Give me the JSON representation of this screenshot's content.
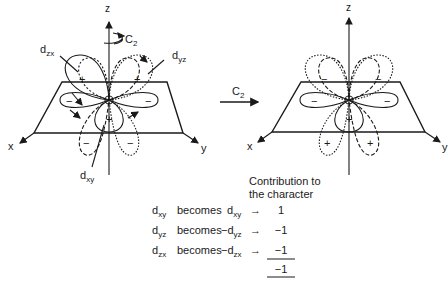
{
  "operation": {
    "label": "C",
    "subscript": "2"
  },
  "left_diagram": {
    "axes": {
      "z": "z",
      "x": "x",
      "y": "y"
    },
    "rotation_label": {
      "label": "C",
      "subscript": "2"
    },
    "orbital_labels": {
      "dzx": {
        "base": "d",
        "sub": "zx"
      },
      "dyz": {
        "base": "d",
        "sub": "yz"
      },
      "dxy": {
        "base": "d",
        "sub": "xy"
      }
    },
    "signs": {
      "dzx_upper": "+",
      "dyz_upper": "+",
      "left_lobe": "−",
      "right_lobe": "−",
      "front_lobe": "+",
      "lower_left": "−",
      "lower_right": "−"
    }
  },
  "right_diagram": {
    "axes": {
      "z": "z",
      "x": "x",
      "y": "y"
    },
    "signs": {
      "upper_left": "−",
      "upper_right": "−",
      "left_lobe": "−",
      "right_lobe": "−",
      "front_lobe": "+",
      "lower_left": "+",
      "lower_right": "+"
    }
  },
  "table": {
    "header_line1": "Contribution to",
    "header_line2": "the character",
    "rows": [
      {
        "from_base": "d",
        "from_sub": "xy",
        "verb": "becomes",
        "to_sign": "",
        "to_base": "d",
        "to_sub": "xy",
        "value": "1"
      },
      {
        "from_base": "d",
        "from_sub": "yz",
        "verb": "becomes",
        "to_sign": "−",
        "to_base": "d",
        "to_sub": "yz",
        "value": "−1"
      },
      {
        "from_base": "d",
        "from_sub": "zx",
        "verb": "becomes",
        "to_sign": "−",
        "to_base": "d",
        "to_sub": "zx",
        "value": "−1"
      }
    ],
    "arrow": "→",
    "total": "−1"
  }
}
